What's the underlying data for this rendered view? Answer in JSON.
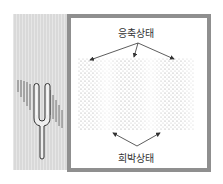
{
  "diagram": {
    "labels": {
      "compression": "응축상태",
      "rarefaction": "희박상태"
    },
    "colors": {
      "panel": "#d9d9d9",
      "frame": "#8f8f8f",
      "dots": "#9a9a9a",
      "arrows": "#333333"
    }
  }
}
